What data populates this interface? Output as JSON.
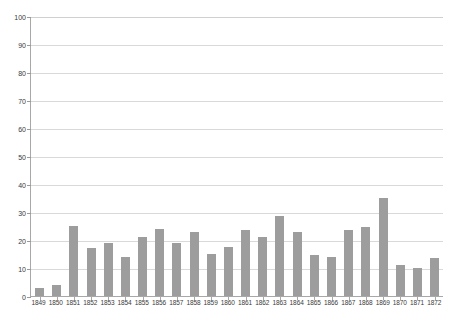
{
  "chart_data": {
    "type": "bar",
    "title": "",
    "xlabel": "",
    "ylabel": "",
    "ylim": [
      0,
      100
    ],
    "ytick_step": 10,
    "yticks": [
      100,
      90,
      80,
      70,
      60,
      50,
      40,
      30,
      20,
      10,
      0
    ],
    "grid": true,
    "legend": "none",
    "bar_color": "#9d9d9d",
    "gridline_color": "#d9d9d9",
    "axis_color": "#a8a8a8",
    "categories": [
      "1849",
      "1850",
      "1851",
      "1852",
      "1853",
      "1854",
      "1855",
      "1856",
      "1857",
      "1858",
      "1859",
      "1860",
      "1861",
      "1862",
      "1863",
      "1864",
      "1865",
      "1866",
      "1867",
      "1868",
      "1869",
      "1870",
      "1871",
      "1872"
    ],
    "values": [
      3,
      4,
      25,
      17,
      19,
      14,
      21,
      24,
      19,
      23,
      15,
      17.5,
      23.5,
      21,
      28.5,
      23,
      14.5,
      14,
      23.5,
      24.5,
      35,
      11,
      10,
      13.5
    ]
  }
}
